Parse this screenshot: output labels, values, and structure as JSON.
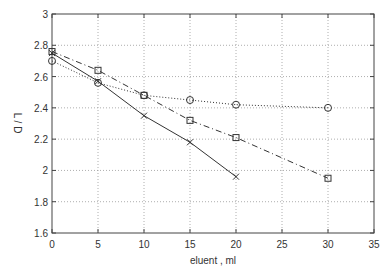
{
  "chart_data": {
    "type": "line",
    "title": "",
    "xlabel": "eluent , ml",
    "ylabel": "L / D",
    "xlim": [
      0,
      35
    ],
    "ylim": [
      1.6,
      3
    ],
    "xticks": [
      0,
      5,
      10,
      15,
      20,
      25,
      30,
      35
    ],
    "yticks": [
      1.6,
      1.8,
      2,
      2.2,
      2.4,
      2.6,
      2.8,
      3
    ],
    "xtick_labels": [
      "0",
      "5",
      "10",
      "15",
      "20",
      "25",
      "30",
      "35"
    ],
    "ytick_labels": [
      "1.6",
      "1.8",
      "2",
      "2.2",
      "2.4",
      "2.6",
      "2.8",
      "3"
    ],
    "grid": true,
    "legend": null,
    "series": [
      {
        "name": "circles",
        "marker": "circle",
        "line": "dotted",
        "x": [
          0,
          5,
          10,
          15,
          20,
          30
        ],
        "values": [
          2.7,
          2.56,
          2.48,
          2.45,
          2.42,
          2.4
        ]
      },
      {
        "name": "squares",
        "marker": "square",
        "line": "dashdot",
        "x": [
          0,
          5,
          10,
          15,
          20,
          30
        ],
        "values": [
          2.76,
          2.64,
          2.48,
          2.32,
          2.21,
          1.95
        ]
      },
      {
        "name": "crosses",
        "marker": "x",
        "line": "solid",
        "x": [
          0,
          5,
          10,
          15,
          20
        ],
        "values": [
          2.75,
          2.57,
          2.35,
          2.18,
          1.96
        ]
      }
    ]
  }
}
